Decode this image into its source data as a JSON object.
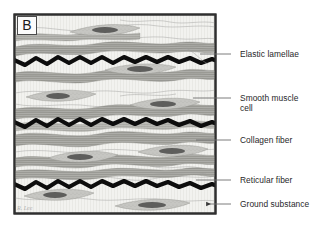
{
  "figure": {
    "panel_letter": "B",
    "signature": "R. Lee",
    "frame": {
      "border_color": "#2f2f2f",
      "fill_color": "#f2f2ef",
      "x": 14,
      "y": 14,
      "width": 202,
      "height": 200
    },
    "palette": {
      "background": "#ffffff",
      "ground_substance": "#f2f2ef",
      "elastic_lamellae": "#0d0d0d",
      "collagen_fiber": "#a8a8a4",
      "collagen_fiber_dark": "#8c8c88",
      "reticular_fiber": "#b9b9b5",
      "smooth_muscle_cell": "#c3c3bf",
      "smooth_muscle_nucleus": "#5e5e5c",
      "label_text": "#28282a",
      "leader_line": "#6e6e6e"
    },
    "callouts": [
      {
        "id": "elastic-lamellae",
        "label": "Elastic lamellae",
        "text_x": 240,
        "text_y": 49,
        "leader": {
          "x1": 231,
          "y1": 54,
          "x2": 200,
          "y2": 54
        },
        "pointer": "line"
      },
      {
        "id": "smooth-muscle-cell",
        "label": "Smooth muscle\ncell",
        "text_x": 240,
        "text_y": 93,
        "leader": {
          "x1": 231,
          "y1": 98,
          "x2": 193,
          "y2": 98
        },
        "pointer": "line"
      },
      {
        "id": "collagen-fiber",
        "label": "Collagen fiber",
        "text_x": 240,
        "text_y": 135,
        "leader": {
          "x1": 231,
          "y1": 140,
          "x2": 196,
          "y2": 140
        },
        "pointer": "line"
      },
      {
        "id": "reticular-fiber",
        "label": "Reticular fiber",
        "text_x": 240,
        "text_y": 175,
        "leader": {
          "x1": 231,
          "y1": 180,
          "x2": 196,
          "y2": 180
        },
        "pointer": "line"
      },
      {
        "id": "ground-substance",
        "label": "Ground substance",
        "text_x": 240,
        "text_y": 199,
        "leader": {
          "x1": 231,
          "y1": 204,
          "x2": 206,
          "y2": 204
        },
        "pointer": "arrow"
      }
    ],
    "structures": {
      "elastic_lamellae_count": 3,
      "collagen_bundle_count": 8,
      "smooth_muscle_cell_count": 8,
      "reticular_fiber_count": 7
    }
  }
}
